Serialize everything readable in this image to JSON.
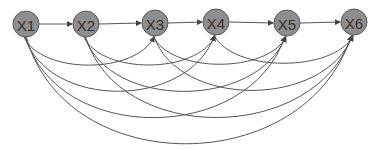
{
  "diagram": {
    "type": "directed-graph",
    "colors": {
      "node_fill": "#8e8e8e",
      "node_stroke": "#5a5a5a",
      "label": "#333333",
      "edge": "#555555"
    },
    "node_radius": 13,
    "nodes": [
      {
        "id": "X1",
        "label": "X1",
        "x": 26,
        "y": 24
      },
      {
        "id": "X2",
        "label": "X2",
        "x": 86,
        "y": 24
      },
      {
        "id": "X3",
        "label": "X3",
        "x": 155,
        "y": 23
      },
      {
        "id": "X4",
        "label": "X4",
        "x": 216,
        "y": 22
      },
      {
        "id": "X5",
        "label": "X5",
        "x": 287,
        "y": 23
      },
      {
        "id": "X6",
        "label": "X6",
        "x": 354,
        "y": 22
      }
    ],
    "edges": [
      {
        "from": "X1",
        "to": "X2",
        "kind": "straight"
      },
      {
        "from": "X2",
        "to": "X3",
        "kind": "straight"
      },
      {
        "from": "X3",
        "to": "X4",
        "kind": "straight"
      },
      {
        "from": "X4",
        "to": "X5",
        "kind": "straight"
      },
      {
        "from": "X5",
        "to": "X6",
        "kind": "straight"
      },
      {
        "from": "X1",
        "to": "X3",
        "kind": "arc"
      },
      {
        "from": "X1",
        "to": "X4",
        "kind": "arc"
      },
      {
        "from": "X1",
        "to": "X5",
        "kind": "arc"
      },
      {
        "from": "X1",
        "to": "X6",
        "kind": "arc"
      },
      {
        "from": "X2",
        "to": "X4",
        "kind": "arc"
      },
      {
        "from": "X2",
        "to": "X5",
        "kind": "arc"
      },
      {
        "from": "X2",
        "to": "X6",
        "kind": "arc"
      },
      {
        "from": "X3",
        "to": "X5",
        "kind": "arc"
      },
      {
        "from": "X3",
        "to": "X6",
        "kind": "arc"
      },
      {
        "from": "X4",
        "to": "X6",
        "kind": "arc"
      }
    ]
  }
}
